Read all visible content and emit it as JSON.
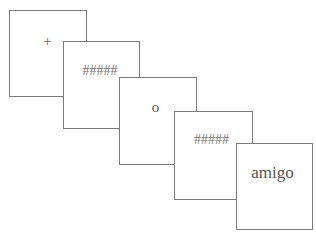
{
  "figure": {
    "title_partial": "Figure: sequence of stimulus presentation",
    "panels": [
      {
        "label": "+",
        "role": "fixation-cross"
      },
      {
        "label": "#####",
        "role": "forward-mask"
      },
      {
        "label": "o",
        "role": "prime"
      },
      {
        "label": "#####",
        "role": "backward-mask"
      },
      {
        "label": "amigo",
        "role": "target-word"
      }
    ]
  },
  "colors": {
    "border": "#7a7a7a",
    "text": "#555555",
    "background": "#ffffff"
  }
}
